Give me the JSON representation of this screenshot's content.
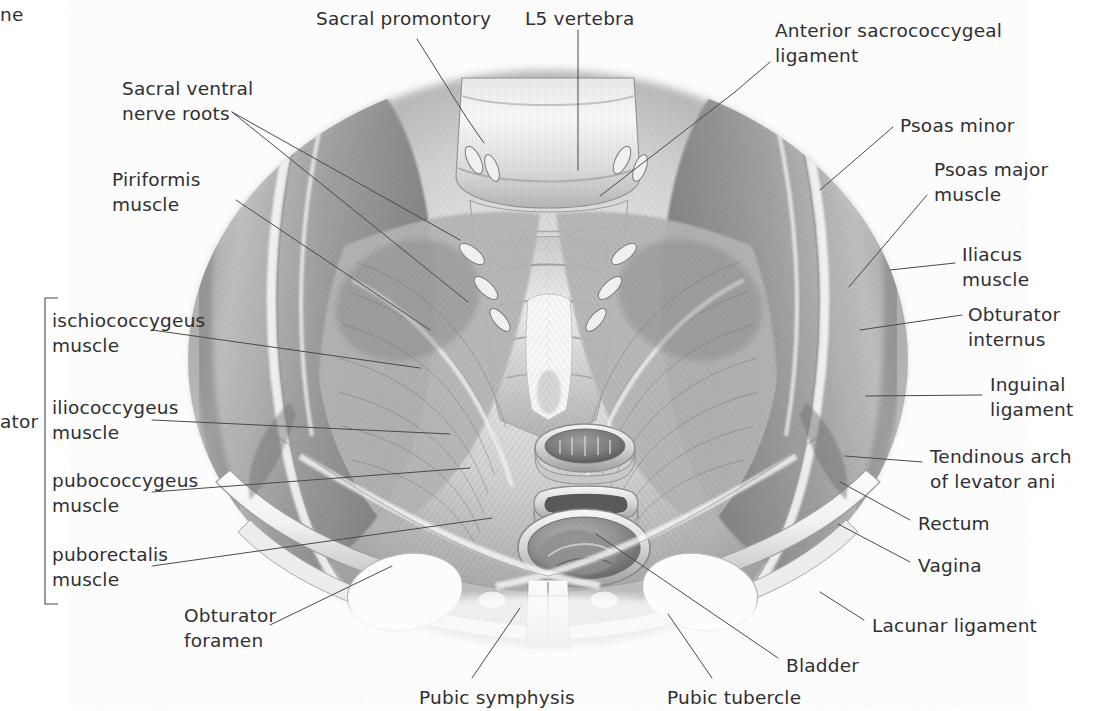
{
  "figure": {
    "medium": "graphite anatomical illustration",
    "background_color": "#ffffff",
    "label_color": "#2f2f31",
    "leader_color": "#4a4a4a"
  },
  "clipped_text": {
    "top_left_fragment": "ne",
    "left_fragment": "ator"
  },
  "bracket": {
    "name": "levator-ani-bracket",
    "groups": [
      "ischiococcygeus muscle",
      "iliococcygeus muscle",
      "pubococcygeus muscle",
      "puborectalis muscle"
    ]
  },
  "labels": [
    {
      "id": "sacral-promontory",
      "line1": "Sacral promontory",
      "line2": "",
      "x": 316,
      "y": 6,
      "align": "left"
    },
    {
      "id": "l5-vertebra",
      "line1": "L5 vertebra",
      "line2": "",
      "x": 525,
      "y": 6,
      "align": "left"
    },
    {
      "id": "anterior-sacrococcygeal-ligament",
      "line1": "Anterior sacrococcygeal",
      "line2": "ligament",
      "x": 775,
      "y": 18,
      "align": "left"
    },
    {
      "id": "sacral-ventral-nerve-roots",
      "line1": "Sacral ventral",
      "line2": "nerve roots",
      "x": 122,
      "y": 76,
      "align": "left"
    },
    {
      "id": "psoas-minor",
      "line1": "Psoas minor",
      "line2": "",
      "x": 900,
      "y": 113,
      "align": "left"
    },
    {
      "id": "psoas-major-muscle",
      "line1": "Psoas major",
      "line2": "muscle",
      "x": 934,
      "y": 157,
      "align": "left"
    },
    {
      "id": "piriformis-muscle",
      "line1": "Piriformis",
      "line2": "muscle",
      "x": 112,
      "y": 167,
      "align": "left"
    },
    {
      "id": "iliacus-muscle",
      "line1": "Iliacus",
      "line2": "muscle",
      "x": 962,
      "y": 242,
      "align": "left"
    },
    {
      "id": "obturator-internus",
      "line1": "Obturator",
      "line2": "internus",
      "x": 968,
      "y": 302,
      "align": "left"
    },
    {
      "id": "ischiococcygeus-muscle",
      "line1": "ischiococcygeus",
      "line2": "muscle",
      "x": 52,
      "y": 308,
      "align": "left"
    },
    {
      "id": "inguinal-ligament",
      "line1": "Inguinal",
      "line2": "ligament",
      "x": 990,
      "y": 372,
      "align": "left"
    },
    {
      "id": "iliococcygeus-muscle",
      "line1": "iliococcygeus",
      "line2": "muscle",
      "x": 52,
      "y": 395,
      "align": "left"
    },
    {
      "id": "tendinous-arch-of-levator-ani",
      "line1": "Tendinous arch",
      "line2": "of levator ani",
      "x": 930,
      "y": 444,
      "align": "left"
    },
    {
      "id": "pubococcygeus-muscle",
      "line1": "pubococcygeus",
      "line2": "muscle",
      "x": 52,
      "y": 468,
      "align": "left"
    },
    {
      "id": "rectum",
      "line1": "Rectum",
      "line2": "",
      "x": 918,
      "y": 511,
      "align": "left"
    },
    {
      "id": "puborectalis-muscle",
      "line1": "puborectalis",
      "line2": "muscle",
      "x": 52,
      "y": 542,
      "align": "left"
    },
    {
      "id": "vagina",
      "line1": "Vagina",
      "line2": "",
      "x": 918,
      "y": 553,
      "align": "left"
    },
    {
      "id": "lacunar-ligament",
      "line1": "Lacunar ligament",
      "line2": "",
      "x": 872,
      "y": 613,
      "align": "left"
    },
    {
      "id": "obturator-foramen",
      "line1": "Obturator",
      "line2": "foramen",
      "x": 184,
      "y": 603,
      "align": "left"
    },
    {
      "id": "bladder",
      "line1": "Bladder",
      "line2": "",
      "x": 786,
      "y": 653,
      "align": "left"
    },
    {
      "id": "pubic-symphysis",
      "line1": "Pubic symphysis",
      "line2": "",
      "x": 419,
      "y": 685,
      "align": "left"
    },
    {
      "id": "pubic-tubercle",
      "line1": "Pubic tubercle",
      "line2": "",
      "x": 667,
      "y": 685,
      "align": "left"
    }
  ],
  "leaders": [
    {
      "id": "leader-sacral-promontory",
      "points": "417,39 468,120 484,143"
    },
    {
      "id": "leader-l5-vertebra",
      "points": "578,30 578,170"
    },
    {
      "id": "leader-anterior-sacrococcygeal",
      "points": "770,62 735,92"
    },
    {
      "id": "leader-anterior-sacrococcygeal-2",
      "points": "735,92 600,196"
    },
    {
      "id": "leader-sacral-ventral-roots-a",
      "points": "232,112 460,240"
    },
    {
      "id": "leader-sacral-ventral-roots-b",
      "points": "232,112 468,302"
    },
    {
      "id": "leader-psoas-minor",
      "points": "893,127 820,190"
    },
    {
      "id": "leader-psoas-major",
      "points": "927,195 849,287"
    },
    {
      "id": "leader-piriformis",
      "points": "236,200 430,330"
    },
    {
      "id": "leader-iliacus",
      "points": "955,263 890,270"
    },
    {
      "id": "leader-obturator-internus",
      "points": "962,315 860,330"
    },
    {
      "id": "leader-ischiococcygeus",
      "points": "152,330 420,368"
    },
    {
      "id": "leader-inguinal-ligament",
      "points": "982,395 866,396"
    },
    {
      "id": "leader-iliococcygeus",
      "points": "152,420 450,434"
    },
    {
      "id": "leader-tendinous-arch",
      "points": "922,462 845,456"
    },
    {
      "id": "leader-pubococcygeus",
      "points": "152,492 470,468"
    },
    {
      "id": "leader-rectum",
      "points": "910,520 840,482"
    },
    {
      "id": "leader-puborectalis",
      "points": "152,566 492,518"
    },
    {
      "id": "leader-vagina",
      "points": "910,562 838,524"
    },
    {
      "id": "leader-lacunar-ligament",
      "points": "864,620 820,592"
    },
    {
      "id": "leader-obturator-foramen",
      "points": "270,625 392,566"
    },
    {
      "id": "leader-bladder",
      "points": "778,658 596,534"
    },
    {
      "id": "leader-pubic-symphysis",
      "points": "472,678 520,608"
    },
    {
      "id": "leader-pubic-tubercle",
      "points": "712,678 668,614"
    }
  ]
}
